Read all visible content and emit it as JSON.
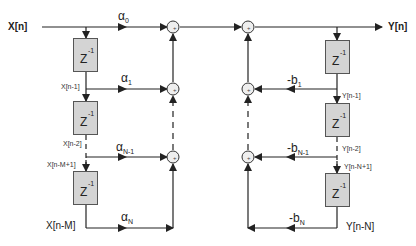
{
  "diagram": {
    "type": "IIR filter direct form I block diagram",
    "input_label": "X[n]",
    "output_label": "Y[n]",
    "delay_label": {
      "base": "Z",
      "exponent": "-1"
    },
    "feedforward": {
      "taps": [
        "X[n-1]",
        "X[n-2]",
        "X[n-M+1]",
        "X[n-M]"
      ],
      "coefficients": [
        {
          "sym": "α",
          "sub": "0"
        },
        {
          "sym": "α",
          "sub": "1"
        },
        {
          "sym": "α",
          "sub": "N-1"
        },
        {
          "sym": "α",
          "sub": "N"
        }
      ]
    },
    "feedback": {
      "taps": [
        "Y[n-1]",
        "Y[n-2]",
        "Y[n-N+1]",
        "Y[n-N]"
      ],
      "coefficients": [
        {
          "sym": "-b",
          "sub": "1"
        },
        {
          "sym": "-b",
          "sub": "N-1"
        },
        {
          "sym": "-b",
          "sub": "N"
        }
      ]
    },
    "adder_symbol": "+",
    "colors": {
      "line": "#222222",
      "box_fill": "#d4d4d4",
      "box_border": "#555555",
      "adder_fill": "#eeeeee"
    }
  }
}
